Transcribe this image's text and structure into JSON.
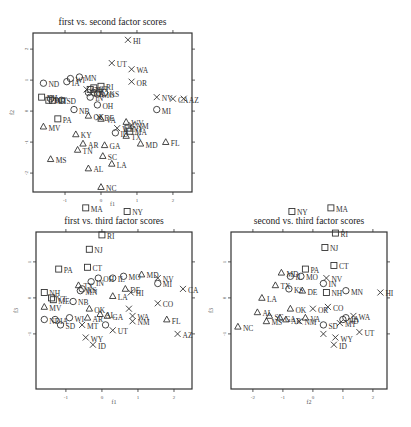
{
  "chart_data": [
    {
      "type": "scatter",
      "title": "first vs. second factor scores",
      "xlabel": "f1",
      "ylabel": "f2",
      "xlim": [
        -1.89,
        2.53
      ],
      "ylim": [
        -2.61,
        2.52
      ],
      "xticks": [
        -1,
        0,
        1,
        2
      ],
      "xtick_labels": [
        "-1",
        "0",
        "1",
        "2"
      ],
      "yticks": [
        -2,
        -1,
        0,
        1,
        2
      ],
      "ytick_labels": [
        "-2",
        "-1",
        "0",
        "1",
        "2"
      ],
      "marker_legend": {
        "square": "group 1",
        "circle": "group 2",
        "triangle": "group 3",
        "cross": "group 4"
      },
      "points": [
        {
          "label": "HI",
          "x": 0.75,
          "y": 2.3,
          "m": "x"
        },
        {
          "label": "UT",
          "x": 0.3,
          "y": 1.55,
          "m": "x"
        },
        {
          "label": "WA",
          "x": 0.85,
          "y": 1.35,
          "m": "x"
        },
        {
          "label": "OR",
          "x": 0.85,
          "y": 0.95,
          "m": "x"
        },
        {
          "label": "ND",
          "x": -1.6,
          "y": 0.9,
          "m": "o"
        },
        {
          "label": "IA",
          "x": -0.95,
          "y": 0.95,
          "m": "o"
        },
        {
          "label": "MN",
          "x": -0.6,
          "y": 1.1,
          "m": "o"
        },
        {
          "label": "RI",
          "x": 0.0,
          "y": 0.8,
          "m": "s"
        },
        {
          "label": "KS",
          "x": 0.1,
          "y": 0.6,
          "m": "o"
        },
        {
          "label": "WI",
          "x": -0.85,
          "y": 1.05,
          "m": "o"
        },
        {
          "label": "NJ",
          "x": -0.3,
          "y": 0.7,
          "m": "s"
        },
        {
          "label": "CT",
          "x": -0.2,
          "y": 0.75,
          "m": "s"
        },
        {
          "label": "NE",
          "x": -0.35,
          "y": 0.6,
          "m": "o"
        },
        {
          "label": "IN",
          "x": -0.3,
          "y": 0.45,
          "m": "o"
        },
        {
          "label": "IL",
          "x": -0.2,
          "y": 0.6,
          "m": "o"
        },
        {
          "label": "MO",
          "x": -0.1,
          "y": 0.55,
          "m": "o"
        },
        {
          "label": "CO",
          "x": -0.4,
          "y": 0.7,
          "m": "x"
        },
        {
          "label": "OH",
          "x": -0.1,
          "y": 0.2,
          "m": "o"
        },
        {
          "label": "NH",
          "x": -1.65,
          "y": 0.45,
          "m": "s"
        },
        {
          "label": "ME",
          "x": -1.45,
          "y": 0.35,
          "m": "s"
        },
        {
          "label": "VT",
          "x": -1.35,
          "y": 0.35,
          "m": "s"
        },
        {
          "label": "MT",
          "x": -1.4,
          "y": 0.4,
          "m": "o"
        },
        {
          "label": "SD",
          "x": -1.1,
          "y": 0.35,
          "m": "o"
        },
        {
          "label": "NB",
          "x": -0.75,
          "y": 0.05,
          "m": "o"
        },
        {
          "label": "OK",
          "x": -0.35,
          "y": -0.15,
          "m": "t"
        },
        {
          "label": "VA",
          "x": 0.0,
          "y": -0.25,
          "m": "t"
        },
        {
          "label": "DE",
          "x": -0.05,
          "y": -0.2,
          "m": "x"
        },
        {
          "label": "NV",
          "x": 1.55,
          "y": 0.45,
          "m": "x"
        },
        {
          "label": "CA",
          "x": 2.0,
          "y": 0.4,
          "m": "x"
        },
        {
          "label": "AZ",
          "x": 2.3,
          "y": 0.4,
          "m": "x"
        },
        {
          "label": "MI",
          "x": 1.55,
          "y": 0.05,
          "m": "o"
        },
        {
          "label": "PA",
          "x": -1.2,
          "y": -0.25,
          "m": "s"
        },
        {
          "label": "MV",
          "x": -1.6,
          "y": -0.5,
          "m": "t"
        },
        {
          "label": "KY",
          "x": -0.7,
          "y": -0.75,
          "m": "t"
        },
        {
          "label": "AR",
          "x": -0.5,
          "y": -1.05,
          "m": "t"
        },
        {
          "label": "TN",
          "x": -0.65,
          "y": -1.25,
          "m": "t"
        },
        {
          "label": "GA",
          "x": 0.1,
          "y": -1.1,
          "m": "t"
        },
        {
          "label": "SC",
          "x": 0.05,
          "y": -1.45,
          "m": "t"
        },
        {
          "label": "LA",
          "x": 0.3,
          "y": -1.7,
          "m": "t"
        },
        {
          "label": "MS",
          "x": -1.4,
          "y": -1.55,
          "m": "t"
        },
        {
          "label": "AL",
          "x": -0.35,
          "y": -1.85,
          "m": "t"
        },
        {
          "label": "NC",
          "x": 0.0,
          "y": -2.45,
          "m": "t"
        },
        {
          "label": "ID",
          "x": 0.4,
          "y": -0.7,
          "m": "o"
        },
        {
          "label": "TX",
          "x": 0.7,
          "y": -0.8,
          "m": "t"
        },
        {
          "label": "NM",
          "x": 0.85,
          "y": -0.45,
          "m": "x"
        },
        {
          "label": "MD",
          "x": 1.1,
          "y": -1.05,
          "m": "t"
        },
        {
          "label": "FL",
          "x": 1.8,
          "y": -1.0,
          "m": "t"
        },
        {
          "label": "WV",
          "x": 0.7,
          "y": -0.35,
          "m": "t"
        },
        {
          "label": "WY",
          "x": 0.45,
          "y": -0.55,
          "m": "x"
        },
        {
          "label": "NY",
          "x": 0.75,
          "y": -0.55,
          "m": "s"
        },
        {
          "label": "MA",
          "x": 0.8,
          "y": -0.65,
          "m": "s"
        }
      ]
    },
    {
      "type": "scatter",
      "title": "first vs. third factor scores",
      "xlabel": "f1",
      "ylabel": "f3",
      "xlim": [
        -1.83,
        2.5
      ],
      "ylim": [
        -2.53,
        1.83
      ],
      "xticks": [
        -1,
        0,
        1,
        2
      ],
      "xtick_labels": [
        "-1",
        "0",
        "1",
        "2"
      ],
      "yticks": [
        -1,
        0,
        1
      ],
      "ytick_labels": [
        "-1",
        "0",
        "1"
      ],
      "points": [
        {
          "label": "MA",
          "x": -0.45,
          "y": 2.5,
          "m": "s"
        },
        {
          "label": "NY",
          "x": 0.7,
          "y": 2.4,
          "m": "s"
        },
        {
          "label": "RI",
          "x": 0.0,
          "y": 1.75,
          "m": "s"
        },
        {
          "label": "NJ",
          "x": -0.35,
          "y": 1.35,
          "m": "s"
        },
        {
          "label": "CT",
          "x": -0.4,
          "y": 0.85,
          "m": "s"
        },
        {
          "label": "PA",
          "x": -1.2,
          "y": 0.8,
          "m": "s"
        },
        {
          "label": "OH",
          "x": -0.1,
          "y": 0.55,
          "m": "o"
        },
        {
          "label": "IL",
          "x": 0.3,
          "y": 0.55,
          "m": "o"
        },
        {
          "label": "MO",
          "x": 0.6,
          "y": 0.6,
          "m": "o"
        },
        {
          "label": "MD",
          "x": 1.1,
          "y": 0.65,
          "m": "t"
        },
        {
          "label": "NV",
          "x": 1.55,
          "y": 0.55,
          "m": "x"
        },
        {
          "label": "MI",
          "x": 1.55,
          "y": 0.4,
          "m": "o"
        },
        {
          "label": "CA",
          "x": 2.25,
          "y": 0.25,
          "m": "x"
        },
        {
          "label": "IN",
          "x": -0.3,
          "y": 0.45,
          "m": "o"
        },
        {
          "label": "NH",
          "x": -1.6,
          "y": 0.15,
          "m": "s"
        },
        {
          "label": "ME",
          "x": -1.35,
          "y": -0.05,
          "m": "s"
        },
        {
          "label": "VT",
          "x": -1.4,
          "y": 0.0,
          "m": "s"
        },
        {
          "label": "TX",
          "x": -0.65,
          "y": 0.35,
          "m": "t"
        },
        {
          "label": "KS",
          "x": -0.55,
          "y": 0.25,
          "m": "o"
        },
        {
          "label": "MN",
          "x": -0.6,
          "y": 0.2,
          "m": "o"
        },
        {
          "label": "DE",
          "x": 0.65,
          "y": 0.25,
          "m": "t"
        },
        {
          "label": "HI",
          "x": 0.8,
          "y": 0.15,
          "m": "x"
        },
        {
          "label": "LA",
          "x": 0.3,
          "y": 0.05,
          "m": "t"
        },
        {
          "label": "MV",
          "x": -1.6,
          "y": -0.25,
          "m": "t"
        },
        {
          "label": "NB",
          "x": -0.8,
          "y": -0.1,
          "m": "o"
        },
        {
          "label": "OK",
          "x": -0.35,
          "y": -0.3,
          "m": "t"
        },
        {
          "label": "CO",
          "x": 1.55,
          "y": -0.15,
          "m": "x"
        },
        {
          "label": "TX2",
          "x": 0.75,
          "y": -0.3,
          "m": "x",
          "hide_label": true
        },
        {
          "label": "WA",
          "x": 0.85,
          "y": -0.5,
          "m": "x"
        },
        {
          "label": "FL",
          "x": 1.8,
          "y": -0.6,
          "m": "t"
        },
        {
          "label": "AZ",
          "x": 2.1,
          "y": -1.0,
          "m": "x"
        },
        {
          "label": "ND",
          "x": -1.6,
          "y": -0.6,
          "m": "o"
        },
        {
          "label": "IA",
          "x": -1.3,
          "y": -0.6,
          "m": "o"
        },
        {
          "label": "WI",
          "x": -0.9,
          "y": -0.55,
          "m": "o"
        },
        {
          "label": "SD",
          "x": -1.15,
          "y": -0.75,
          "m": "o"
        },
        {
          "label": "MT",
          "x": -0.55,
          "y": -0.75,
          "m": "x"
        },
        {
          "label": "AR",
          "x": -0.4,
          "y": -0.55,
          "m": "t"
        },
        {
          "label": "GA",
          "x": 0.15,
          "y": -0.5,
          "m": "t"
        },
        {
          "label": "NM",
          "x": 0.85,
          "y": -0.65,
          "m": "x"
        },
        {
          "label": "KS2",
          "x": 0.1,
          "y": -0.75,
          "m": "o",
          "hide_label": true
        },
        {
          "label": "UT",
          "x": 0.3,
          "y": -0.9,
          "m": "x"
        },
        {
          "label": "WY",
          "x": -0.45,
          "y": -1.1,
          "m": "x"
        },
        {
          "label": "ID",
          "x": -0.25,
          "y": -1.3,
          "m": "x"
        },
        {
          "label": "AL",
          "x": -0.05,
          "y": -0.45,
          "m": "t"
        }
      ]
    },
    {
      "type": "scatter",
      "title": "second vs. third factor scores",
      "xlabel": "f2",
      "ylabel": "f3",
      "xlim": [
        -2.73,
        2.47
      ],
      "ylim": [
        -2.53,
        1.83
      ],
      "xticks": [
        -2,
        -1,
        0,
        1,
        2
      ],
      "xtick_labels": [
        "-2",
        "-1",
        "0",
        "1",
        "2"
      ],
      "yticks": [
        -1,
        0,
        1
      ],
      "ytick_labels": [
        "-1",
        "0",
        "1"
      ],
      "points": [
        {
          "label": "MA",
          "x": 0.6,
          "y": 2.5,
          "m": "s"
        },
        {
          "label": "NY",
          "x": -0.7,
          "y": 2.4,
          "m": "s"
        },
        {
          "label": "RI",
          "x": 0.75,
          "y": 1.8,
          "m": "s"
        },
        {
          "label": "NJ",
          "x": 0.4,
          "y": 1.4,
          "m": "s"
        },
        {
          "label": "CT",
          "x": 0.7,
          "y": 0.9,
          "m": "s"
        },
        {
          "label": "PA",
          "x": -0.25,
          "y": 0.8,
          "m": "s"
        },
        {
          "label": "MD",
          "x": -1.05,
          "y": 0.7,
          "m": "t"
        },
        {
          "label": "IL",
          "x": -0.75,
          "y": 0.6,
          "m": "o"
        },
        {
          "label": "MO",
          "x": -0.4,
          "y": 0.6,
          "m": "o"
        },
        {
          "label": "NV",
          "x": 0.45,
          "y": 0.55,
          "m": "x"
        },
        {
          "label": "IN",
          "x": 0.35,
          "y": 0.4,
          "m": "o"
        },
        {
          "label": "MN",
          "x": 1.1,
          "y": 0.2,
          "m": "o"
        },
        {
          "label": "HI",
          "x": 2.25,
          "y": 0.15,
          "m": "x"
        },
        {
          "label": "TX",
          "x": -1.25,
          "y": 0.35,
          "m": "t"
        },
        {
          "label": "KS",
          "x": -0.8,
          "y": 0.25,
          "m": "o"
        },
        {
          "label": "DE",
          "x": -0.35,
          "y": 0.2,
          "m": "t"
        },
        {
          "label": "NH",
          "x": 0.45,
          "y": 0.15,
          "m": "s"
        },
        {
          "label": "LA",
          "x": -1.7,
          "y": 0.0,
          "m": "t"
        },
        {
          "label": "OK",
          "x": -0.75,
          "y": -0.3,
          "m": "t"
        },
        {
          "label": "OR",
          "x": 0.0,
          "y": -0.3,
          "m": "x"
        },
        {
          "label": "CO",
          "x": 0.5,
          "y": -0.25,
          "m": "x"
        },
        {
          "label": "VA",
          "x": -0.25,
          "y": -0.55,
          "m": "t"
        },
        {
          "label": "NM",
          "x": -0.45,
          "y": -0.65,
          "m": "x"
        },
        {
          "label": "AL",
          "x": -1.85,
          "y": -0.4,
          "m": "t"
        },
        {
          "label": "SC",
          "x": -1.45,
          "y": -0.5,
          "m": "t"
        },
        {
          "label": "GA",
          "x": -1.1,
          "y": -0.55,
          "m": "t"
        },
        {
          "label": "MS",
          "x": -1.55,
          "y": -0.65,
          "m": "t"
        },
        {
          "label": "AR",
          "x": -0.9,
          "y": -0.6,
          "m": "t"
        },
        {
          "label": "NC",
          "x": -2.5,
          "y": -0.8,
          "m": "t"
        },
        {
          "label": "WA",
          "x": 1.35,
          "y": -0.5,
          "m": "x"
        },
        {
          "label": "SD",
          "x": 0.35,
          "y": -0.75,
          "m": "o"
        },
        {
          "label": "MT",
          "x": 0.9,
          "y": -0.7,
          "m": "x"
        },
        {
          "label": "ND",
          "x": 1.0,
          "y": -0.6,
          "m": "o"
        },
        {
          "label": "IA",
          "x": 1.1,
          "y": -0.55,
          "m": "o"
        },
        {
          "label": "UT",
          "x": 1.55,
          "y": -0.95,
          "m": "x"
        },
        {
          "label": "WY",
          "x": 0.75,
          "y": -1.1,
          "m": "x"
        },
        {
          "label": "AZ",
          "x": 0.35,
          "y": -1.0,
          "m": "x",
          "hide_label": true
        },
        {
          "label": "ID",
          "x": 0.7,
          "y": -1.3,
          "m": "x"
        }
      ]
    }
  ]
}
